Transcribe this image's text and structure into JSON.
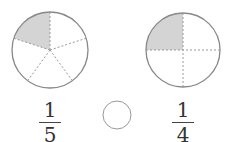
{
  "diagram": {
    "left_circle": {
      "parts": 5,
      "shaded": 1,
      "fraction": {
        "numerator": "1",
        "denominator": "5"
      }
    },
    "right_circle": {
      "parts": 4,
      "shaded": 1,
      "fraction": {
        "numerator": "1",
        "denominator": "4"
      }
    },
    "comparison_blank": "",
    "colors": {
      "outline": "#888888",
      "shade": "#d4d4d4",
      "dash": "#999999"
    }
  }
}
